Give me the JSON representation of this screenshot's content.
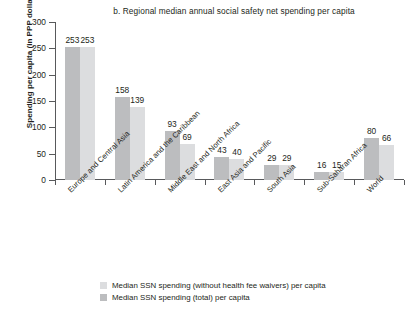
{
  "chart_data": {
    "type": "bar",
    "title": "b. Regional median annual social safety net spending per capita",
    "xlabel": "",
    "ylabel": "Spending per capita (in PPP dollars)",
    "ylim": [
      0,
      300
    ],
    "yticks": [
      0,
      50,
      100,
      150,
      200,
      250,
      300
    ],
    "grid": false,
    "legend_position": "bottom",
    "categories": [
      "Europe and Central Asia",
      "Latin America and the Caribbean",
      "Middle East and North Africa",
      "East Asia and Pacific",
      "South Asia",
      "Sub-Saharan Africa",
      "World"
    ],
    "series": [
      {
        "name": "Median SSN spending (total) per capita",
        "color": "#bcbdbf",
        "values": [
          253,
          158,
          93,
          43,
          29,
          16,
          80
        ]
      },
      {
        "name": "Median SSN spending (without health fee waivers) per capita",
        "color": "#dcdddf",
        "values": [
          253,
          139,
          69,
          40,
          29,
          15,
          66
        ]
      }
    ]
  },
  "legend": {
    "items": [
      {
        "label": "Median SSN spending (without health fee waivers) per capita",
        "swatch": "nohfw"
      },
      {
        "label": "Median SSN spending (total) per capita",
        "swatch": "total"
      }
    ]
  }
}
